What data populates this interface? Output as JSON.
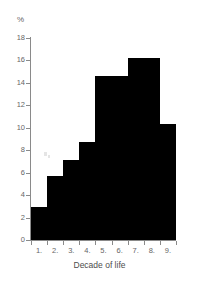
{
  "chart_data": {
    "type": "bar",
    "title": "",
    "subtitle": "",
    "xlabel": "Decade of life",
    "ylabel": "%",
    "categories": [
      "1.",
      "2.",
      "3.",
      "4.",
      "5.",
      "6.",
      "7.",
      "8.",
      "9."
    ],
    "values": [
      2.9,
      5.7,
      7.1,
      8.7,
      14.6,
      14.6,
      16.2,
      16.2,
      10.3
    ],
    "ylim": [
      0,
      18
    ],
    "ytick_labels": [
      "0",
      "2",
      "4",
      "6",
      "8",
      "10",
      "12",
      "14",
      "16",
      "18"
    ],
    "ytick_values": [
      0,
      2,
      4,
      6,
      8,
      10,
      12,
      14,
      16,
      18
    ],
    "xlim_categories": 9,
    "grid": false,
    "legend": null,
    "bar_color": "#000000",
    "axis_color": "#8a8a8a",
    "text_color": "#666666",
    "annotations": []
  },
  "figure": {
    "unit_label": "%",
    "x_axis_title": "Decade of life",
    "background_color": "#ffffff"
  }
}
